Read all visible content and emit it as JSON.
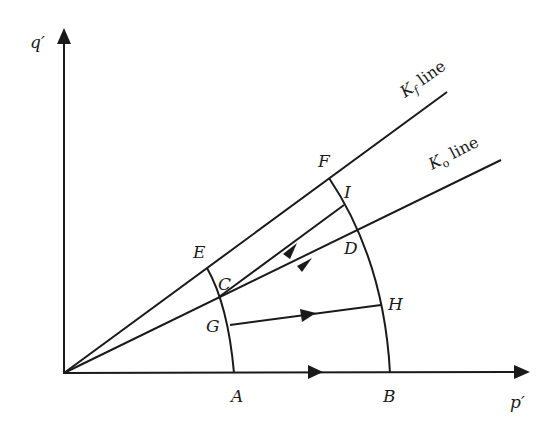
{
  "axes": {
    "y_label": "q′",
    "x_label": "p′"
  },
  "lines": {
    "kf": {
      "symbol": "K",
      "subscript": "f",
      "suffix": " line"
    },
    "ko": {
      "symbol": "K",
      "subscript": "o",
      "suffix": " line"
    }
  },
  "points": {
    "A": "A",
    "B": "B",
    "C": "C",
    "D": "D",
    "E": "E",
    "F": "F",
    "G": "G",
    "H": "H",
    "I": "I"
  },
  "colors": {
    "ink": "#1a1a1a",
    "background": "#ffffff"
  },
  "paths": [
    {
      "from": "A",
      "to": "B",
      "arrow": true
    },
    {
      "from": "G",
      "to": "H",
      "arrow": true
    },
    {
      "from": "C",
      "to": "I",
      "arrow": true
    },
    {
      "from": "C",
      "to": "D",
      "arrow": true
    }
  ]
}
